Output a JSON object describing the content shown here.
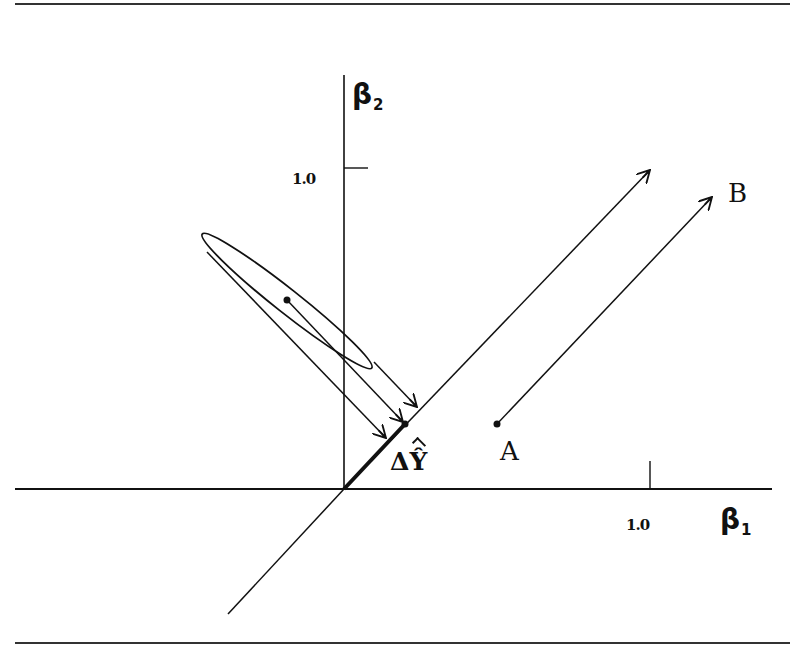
{
  "figure": {
    "axes": {
      "x_label": "β",
      "x_label_sub": "1",
      "y_label": "β",
      "y_label_sub": "2",
      "x_tick_label": "1.0",
      "y_tick_label": "1.0"
    },
    "labels": {
      "delta_y": "Δ",
      "delta_y_hat": "Ŷ",
      "point_a": "A",
      "point_b": "B"
    },
    "colors": {
      "ink": "#111111",
      "background": "#ffffff"
    }
  }
}
